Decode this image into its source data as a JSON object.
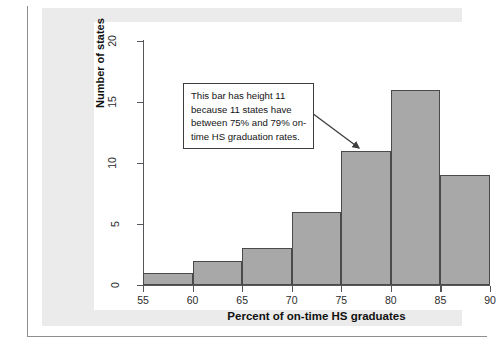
{
  "chart_data": {
    "type": "bar",
    "title": "",
    "subtitle": "",
    "xlabel": "Percent of on-time HS graduates",
    "ylabel": "Number of states",
    "categories": [
      "55-60",
      "60-65",
      "65-70",
      "70-75",
      "75-80",
      "80-85",
      "85-90"
    ],
    "bin_edges": [
      55,
      60,
      65,
      70,
      75,
      80,
      85,
      90
    ],
    "values": [
      1,
      2,
      3,
      6,
      11,
      16,
      9
    ],
    "bin_width": 5,
    "xlim": [
      55,
      90
    ],
    "ylim": [
      0,
      20
    ],
    "x_ticks": [
      "55",
      "60",
      "65",
      "70",
      "75",
      "80",
      "85",
      "90"
    ],
    "y_ticks": [
      "0",
      "5",
      "10",
      "15",
      "20"
    ],
    "grid": false,
    "legend": false,
    "legend_position": "none",
    "annotations": [
      {
        "text": "This bar has height 11 because 11 states have between 75% and 79% on-time HS graduation rates.",
        "points_to_bin": "75-80",
        "points_to_value": 11
      }
    ],
    "colors": {
      "bar_fill": "#a8a8a8",
      "bar_stroke": "#4a4a4a",
      "axis": "#55565a",
      "panel_background": "#ebebeb",
      "plot_background": "#ffffff",
      "annotation_border": "#3d3d3d",
      "text": "#111111"
    }
  }
}
